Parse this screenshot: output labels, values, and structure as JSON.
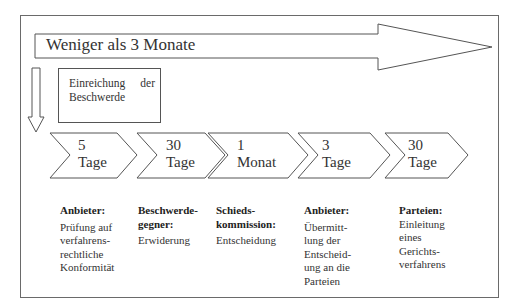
{
  "timeline": {
    "total_duration_label": "Weniger als 3 Monate",
    "start_box_label": "Einreichung der Beschwerde"
  },
  "phases": [
    {
      "duration_number": "5",
      "duration_unit": "Tage",
      "actor": "Anbieter:",
      "description": "Prüfung auf verfahrens-rechtliche Konformität"
    },
    {
      "duration_number": "30",
      "duration_unit": "Tage",
      "actor": "Beschwerde-gegner:",
      "description": "Erwiderung"
    },
    {
      "duration_number": "1",
      "duration_unit": "Monat",
      "actor": "Schieds-kommission:",
      "description": "Entscheidung"
    },
    {
      "duration_number": "3",
      "duration_unit": "Tage",
      "actor": "Anbieter:",
      "description": "Übermitt-lung der Entscheid-ung an die Parteien"
    },
    {
      "duration_number": "30",
      "duration_unit": "Tage",
      "actor": "Parteien:",
      "description": "Einleitung eines Gerichts-verfahrens"
    }
  ],
  "colors": {
    "stroke": "#555555",
    "frame": "#6a6a6a",
    "text": "#333333"
  }
}
